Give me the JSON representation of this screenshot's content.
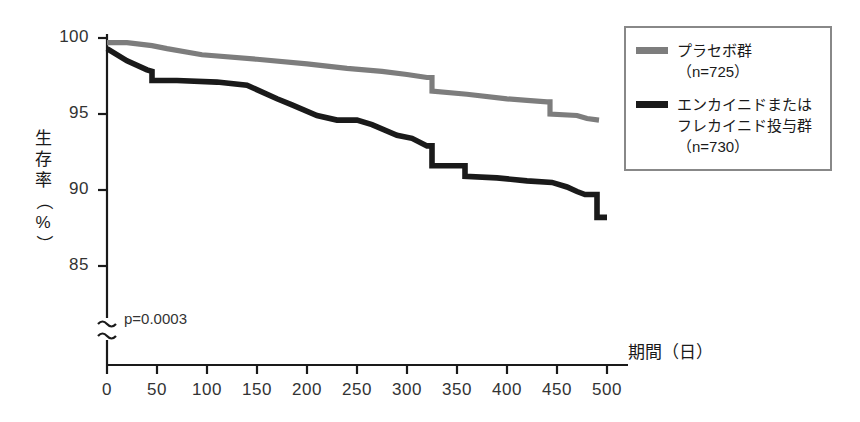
{
  "figure": {
    "background_color": "#ffffff",
    "pvalue_text": "p=0.0003"
  },
  "axes": {
    "y_title": "生存率（%）",
    "y_title_chars": [
      "生",
      "存",
      "率",
      "（",
      "%",
      "）"
    ],
    "x_title": "期間（日）",
    "y_ticks": [
      "100",
      "95",
      "90",
      "85"
    ],
    "x_ticks": [
      "0",
      "50",
      "100",
      "150",
      "200",
      "250",
      "300",
      "350",
      "400",
      "450",
      "500"
    ],
    "axis_break_symbol": "≈"
  },
  "legend": {
    "border_color": "#888888",
    "entries": [
      {
        "label": "プラセボ群\n（n=725）",
        "name": "プラセボ群",
        "n": "725",
        "color": "#7d7d7d"
      },
      {
        "label": "エンカイニドまたは\nフレカイニド投与群\n（n=730）",
        "name": "エンカイニドまたはフレカイニド投与群",
        "n": "730",
        "color": "#1a1a1a"
      }
    ]
  },
  "chart_data": {
    "type": "line",
    "title": "",
    "subtitle": "",
    "xlabel": "期間（日）",
    "ylabel": "生存率（%）",
    "xlim": [
      0,
      500
    ],
    "ylim": [
      85,
      100
    ],
    "y_axis_break_below": 85,
    "grid": false,
    "legend_position": "top-right",
    "annotations": [
      {
        "text": "p=0.0003",
        "x": 30,
        "y": 86.2
      }
    ],
    "series": [
      {
        "name": "プラセボ群（n=725）",
        "color": "#7d7d7d",
        "n": 725,
        "x": [
          0,
          20,
          45,
          60,
          95,
          150,
          200,
          240,
          275,
          300,
          320,
          325,
          325,
          360,
          400,
          420,
          440,
          443,
          443,
          470,
          480,
          492
        ],
        "y": [
          99.7,
          99.7,
          99.5,
          99.3,
          98.9,
          98.6,
          98.3,
          98.0,
          97.8,
          97.6,
          97.4,
          97.4,
          96.5,
          96.3,
          96.0,
          95.9,
          95.8,
          95.8,
          95.0,
          94.9,
          94.7,
          94.6
        ]
      },
      {
        "name": "エンカイニドまたはフレカイニド投与群（n=730）",
        "color": "#1a1a1a",
        "n": 730,
        "x": [
          0,
          20,
          40,
          45,
          45,
          70,
          110,
          140,
          170,
          185,
          210,
          230,
          250,
          265,
          290,
          305,
          320,
          325,
          325,
          358,
          358,
          390,
          420,
          445,
          460,
          470,
          478,
          488,
          490,
          490,
          500
        ],
        "y": [
          99.3,
          98.5,
          97.9,
          97.8,
          97.2,
          97.2,
          97.1,
          96.9,
          96.0,
          95.6,
          94.9,
          94.6,
          94.6,
          94.3,
          93.6,
          93.4,
          92.9,
          92.9,
          91.6,
          91.6,
          90.9,
          90.8,
          90.6,
          90.5,
          90.2,
          89.9,
          89.7,
          89.7,
          89.7,
          88.2,
          88.2
        ]
      }
    ]
  },
  "plot_geometry": {
    "x0_px": 107,
    "x500_px": 607,
    "y100_px": 38,
    "y85_px": 266,
    "axis_base_px": 365
  }
}
